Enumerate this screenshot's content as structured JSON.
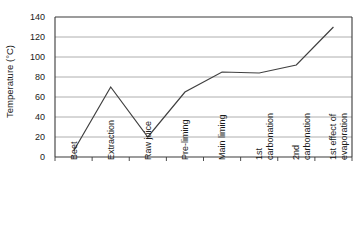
{
  "chart_data": {
    "type": "line",
    "title": "",
    "xlabel": "",
    "ylabel": "Temperature (°C)",
    "categories": [
      "Beet",
      "Extraction",
      "Raw juice",
      "Pre-liming",
      "Main liming",
      "1st carbonation",
      "2nd carbonation",
      "1st effect of evaporation"
    ],
    "category_lines": [
      [
        "Beet"
      ],
      [
        "Extraction"
      ],
      [
        "Raw juice"
      ],
      [
        "Pre-liming"
      ],
      [
        "Main liming"
      ],
      [
        "1st",
        "carbonation"
      ],
      [
        "2nd",
        "carbonation"
      ],
      [
        "1st effect of",
        "evaporation"
      ]
    ],
    "values": [
      6,
      70,
      20,
      65,
      85,
      84,
      92,
      130
    ],
    "ylim": [
      0,
      140
    ],
    "ytick_values": [
      0,
      20,
      40,
      60,
      80,
      100,
      120,
      140
    ],
    "ytick_labels": [
      "0",
      "20",
      "40",
      "60",
      "80",
      "100",
      "120",
      "140"
    ],
    "grid": true,
    "grid_axis": "y",
    "legend": "none",
    "line_color": "#404040",
    "grid_color": "#9a9a9a",
    "axis_color": "#3a3a3a",
    "background_color": "#ffffff"
  }
}
